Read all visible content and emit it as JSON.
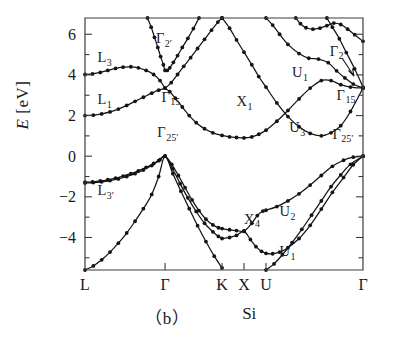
{
  "figure": {
    "caption_panel": "（b）",
    "caption_material": "Si",
    "ylabel_symbol": "E",
    "ylabel_unit": "[eV]"
  },
  "chart_data": {
    "type": "line",
    "title": "",
    "subtitle": "Si",
    "xlabel": "",
    "ylabel": "E [eV]",
    "ylim": [
      -5.6,
      6.8
    ],
    "yticks": [
      -4,
      -2,
      0,
      2,
      4,
      6
    ],
    "ytick_labels": [
      "-4",
      "-2",
      "0",
      "2",
      "4",
      "6"
    ],
    "yminor_step": 1,
    "grid": false,
    "legend_position": "none",
    "xaxis_type": "high-symmetry-path",
    "xticks": [
      0.0,
      0.288,
      0.493,
      0.572,
      0.651,
      1.0
    ],
    "xtick_labels": [
      "L",
      "Γ",
      "K",
      "X",
      "U",
      "Γ"
    ],
    "annotations": [
      {
        "text": "L",
        "sub": "3",
        "x": 0.045,
        "y": 4.62
      },
      {
        "text": "L",
        "sub": "1",
        "x": 0.045,
        "y": 2.55
      },
      {
        "text": "Γ",
        "sub": "2′",
        "x": 0.255,
        "y": 5.55
      },
      {
        "text": "Γ",
        "sub": "15",
        "x": 0.275,
        "y": 2.68
      },
      {
        "text": "Γ",
        "sub": "25′",
        "x": 0.26,
        "y": 0.92
      },
      {
        "text": "L",
        "sub": "3′",
        "x": 0.045,
        "y": -1.92
      },
      {
        "text": "X",
        "sub": "1",
        "x": 0.545,
        "y": 2.45
      },
      {
        "text": "X",
        "sub": "4",
        "x": 0.572,
        "y": -3.32
      },
      {
        "text": "U",
        "sub": "1",
        "x": 0.745,
        "y": 3.88
      },
      {
        "text": "U",
        "sub": "3",
        "x": 0.735,
        "y": 1.18
      },
      {
        "text": "U",
        "sub": "2",
        "x": 0.7,
        "y": -2.95
      },
      {
        "text": "U",
        "sub": "1",
        "x": 0.7,
        "y": -4.92
      },
      {
        "text": "Γ",
        "sub": "2",
        "x": 0.88,
        "y": 4.95
      },
      {
        "text": "Γ",
        "sub": "15",
        "x": 0.905,
        "y": 2.78
      },
      {
        "text": "Γ",
        "sub": "25′",
        "x": 0.89,
        "y": 0.85
      }
    ],
    "series": [
      {
        "name": "valence-band-1",
        "points": [
          [
            0.0,
            -1.28
          ],
          [
            0.027,
            -1.26
          ],
          [
            0.055,
            -1.22
          ],
          [
            0.082,
            -1.16
          ],
          [
            0.11,
            -1.08
          ],
          [
            0.137,
            -0.98
          ],
          [
            0.165,
            -0.86
          ],
          [
            0.192,
            -0.72
          ],
          [
            0.22,
            -0.55
          ],
          [
            0.247,
            -0.36
          ],
          [
            0.27,
            -0.17
          ],
          [
            0.288,
            0.0
          ],
          [
            0.312,
            -0.4
          ],
          [
            0.336,
            -0.95
          ],
          [
            0.36,
            -1.55
          ],
          [
            0.385,
            -2.15
          ],
          [
            0.41,
            -2.68
          ],
          [
            0.435,
            -3.1
          ],
          [
            0.46,
            -3.38
          ],
          [
            0.48,
            -3.52
          ],
          [
            0.493,
            -3.56
          ],
          [
            0.52,
            -3.62
          ],
          [
            0.545,
            -3.66
          ],
          [
            0.572,
            -3.68
          ],
          [
            0.6,
            -3.3
          ],
          [
            0.62,
            -2.92
          ],
          [
            0.64,
            -2.7
          ],
          [
            0.651,
            -2.66
          ],
          [
            0.69,
            -2.48
          ],
          [
            0.73,
            -2.2
          ],
          [
            0.77,
            -1.85
          ],
          [
            0.81,
            -1.42
          ],
          [
            0.85,
            -0.95
          ],
          [
            0.89,
            -0.5
          ],
          [
            0.93,
            -0.2
          ],
          [
            0.965,
            -0.05
          ],
          [
            1.0,
            0.0
          ]
        ]
      },
      {
        "name": "valence-band-2",
        "points": [
          [
            0.0,
            -1.32
          ],
          [
            0.03,
            -1.3
          ],
          [
            0.06,
            -1.26
          ],
          [
            0.09,
            -1.2
          ],
          [
            0.12,
            -1.12
          ],
          [
            0.15,
            -1.0
          ],
          [
            0.18,
            -0.86
          ],
          [
            0.21,
            -0.68
          ],
          [
            0.24,
            -0.46
          ],
          [
            0.265,
            -0.22
          ],
          [
            0.288,
            0.0
          ],
          [
            0.315,
            -0.62
          ],
          [
            0.342,
            -1.35
          ],
          [
            0.37,
            -2.05
          ],
          [
            0.4,
            -2.72
          ],
          [
            0.43,
            -3.3
          ],
          [
            0.46,
            -3.72
          ],
          [
            0.48,
            -3.95
          ],
          [
            0.493,
            -4.05
          ],
          [
            0.52,
            -4.0
          ],
          [
            0.545,
            -3.9
          ],
          [
            0.572,
            -3.7
          ],
          [
            0.595,
            -4.1
          ],
          [
            0.615,
            -4.45
          ],
          [
            0.635,
            -4.68
          ],
          [
            0.651,
            -4.78
          ],
          [
            0.675,
            -4.8
          ],
          [
            0.7,
            -4.72
          ],
          [
            0.73,
            -4.5
          ],
          [
            0.77,
            -4.05
          ],
          [
            0.81,
            -3.4
          ],
          [
            0.85,
            -2.6
          ],
          [
            0.89,
            -1.78
          ],
          [
            0.93,
            -1.05
          ],
          [
            0.965,
            -0.42
          ],
          [
            1.0,
            0.0
          ]
        ]
      },
      {
        "name": "valence-band-3-lower",
        "points": [
          [
            0.0,
            -5.6
          ],
          [
            0.03,
            -5.4
          ],
          [
            0.06,
            -5.1
          ],
          [
            0.09,
            -4.72
          ],
          [
            0.12,
            -4.28
          ],
          [
            0.15,
            -3.78
          ],
          [
            0.18,
            -3.2
          ],
          [
            0.21,
            -2.58
          ],
          [
            0.24,
            -1.88
          ],
          [
            0.265,
            -1.0
          ],
          [
            0.288,
            0.0
          ],
          [
            0.316,
            -0.86
          ],
          [
            0.345,
            -1.72
          ],
          [
            0.375,
            -2.58
          ],
          [
            0.405,
            -3.42
          ],
          [
            0.435,
            -4.2
          ],
          [
            0.465,
            -4.92
          ],
          [
            0.493,
            -5.5
          ]
        ]
      },
      {
        "name": "valence-band-3-right",
        "points": [
          [
            0.651,
            -5.6
          ],
          [
            0.68,
            -5.3
          ],
          [
            0.71,
            -4.85
          ],
          [
            0.745,
            -4.25
          ],
          [
            0.78,
            -3.6
          ],
          [
            0.815,
            -2.9
          ],
          [
            0.85,
            -2.2
          ],
          [
            0.885,
            -1.5
          ],
          [
            0.92,
            -0.92
          ],
          [
            0.955,
            -0.4
          ],
          [
            1.0,
            0.0
          ]
        ]
      },
      {
        "name": "conduction-band-1",
        "points": [
          [
            0.0,
            4.02
          ],
          [
            0.027,
            4.05
          ],
          [
            0.055,
            4.12
          ],
          [
            0.082,
            4.22
          ],
          [
            0.11,
            4.32
          ],
          [
            0.137,
            4.38
          ],
          [
            0.165,
            4.4
          ],
          [
            0.192,
            4.35
          ],
          [
            0.22,
            4.22
          ],
          [
            0.247,
            4.02
          ],
          [
            0.27,
            3.72
          ],
          [
            0.288,
            3.35
          ],
          [
            0.305,
            3.18
          ],
          [
            0.325,
            2.85
          ],
          [
            0.35,
            2.42
          ],
          [
            0.375,
            2.0
          ],
          [
            0.4,
            1.65
          ],
          [
            0.43,
            1.35
          ],
          [
            0.46,
            1.15
          ],
          [
            0.493,
            1.02
          ],
          [
            0.52,
            0.95
          ],
          [
            0.545,
            0.92
          ],
          [
            0.572,
            0.9
          ],
          [
            0.6,
            0.95
          ],
          [
            0.625,
            1.08
          ],
          [
            0.651,
            1.28
          ],
          [
            0.69,
            1.72
          ],
          [
            0.73,
            2.25
          ],
          [
            0.77,
            2.82
          ],
          [
            0.81,
            3.35
          ],
          [
            0.85,
            3.72
          ],
          [
            0.885,
            3.72
          ],
          [
            0.92,
            3.52
          ],
          [
            0.955,
            3.4
          ],
          [
            1.0,
            3.35
          ]
        ]
      },
      {
        "name": "conduction-band-2",
        "points": [
          [
            0.0,
            2.0
          ],
          [
            0.03,
            2.02
          ],
          [
            0.06,
            2.08
          ],
          [
            0.09,
            2.18
          ],
          [
            0.12,
            2.32
          ],
          [
            0.15,
            2.5
          ],
          [
            0.18,
            2.7
          ],
          [
            0.21,
            2.9
          ],
          [
            0.24,
            3.1
          ],
          [
            0.265,
            3.25
          ],
          [
            0.288,
            3.35
          ],
          [
            0.31,
            3.62
          ],
          [
            0.333,
            4.02
          ],
          [
            0.355,
            4.42
          ],
          [
            0.38,
            4.85
          ],
          [
            0.405,
            5.3
          ],
          [
            0.43,
            5.75
          ],
          [
            0.455,
            6.2
          ],
          [
            0.478,
            6.6
          ],
          [
            0.493,
            6.8
          ]
        ]
      },
      {
        "name": "conduction-band-3-gamma2prime",
        "points": [
          [
            0.225,
            6.8
          ],
          [
            0.238,
            6.35
          ],
          [
            0.25,
            5.85
          ],
          [
            0.262,
            5.35
          ],
          [
            0.272,
            4.9
          ],
          [
            0.282,
            4.5
          ],
          [
            0.288,
            4.22
          ],
          [
            0.296,
            4.22
          ],
          [
            0.305,
            4.35
          ],
          [
            0.318,
            4.62
          ],
          [
            0.333,
            4.95
          ],
          [
            0.35,
            5.35
          ],
          [
            0.37,
            5.8
          ],
          [
            0.39,
            6.28
          ],
          [
            0.41,
            6.8
          ]
        ]
      },
      {
        "name": "conduction-band-4-right-upper",
        "points": [
          [
            0.651,
            6.8
          ],
          [
            0.675,
            6.45
          ],
          [
            0.7,
            6.0
          ],
          [
            0.73,
            5.5
          ],
          [
            0.77,
            5.05
          ],
          [
            0.805,
            4.82
          ],
          [
            0.84,
            4.78
          ],
          [
            0.875,
            4.6
          ],
          [
            0.905,
            4.2
          ],
          [
            0.935,
            3.85
          ],
          [
            0.965,
            3.55
          ],
          [
            1.0,
            3.35
          ]
        ]
      },
      {
        "name": "conduction-band-5-right-top",
        "points": [
          [
            0.758,
            6.8
          ],
          [
            0.775,
            6.52
          ],
          [
            0.795,
            6.32
          ],
          [
            0.82,
            6.25
          ],
          [
            0.845,
            6.3
          ],
          [
            0.87,
            6.42
          ],
          [
            0.895,
            6.55
          ],
          [
            0.92,
            6.48
          ],
          [
            0.945,
            6.25
          ],
          [
            0.97,
            5.98
          ],
          [
            1.0,
            5.65
          ]
        ]
      },
      {
        "name": "conduction-band-6-right-steep",
        "points": [
          [
            0.87,
            6.8
          ],
          [
            0.89,
            6.35
          ],
          [
            0.915,
            5.78
          ],
          [
            0.94,
            5.1
          ],
          [
            0.97,
            4.3
          ],
          [
            1.0,
            3.4
          ]
        ]
      },
      {
        "name": "conduction-band-X1-branch",
        "points": [
          [
            0.493,
            6.8
          ],
          [
            0.52,
            6.3
          ],
          [
            0.545,
            5.72
          ],
          [
            0.572,
            5.12
          ],
          [
            0.6,
            4.5
          ],
          [
            0.625,
            3.92
          ],
          [
            0.651,
            3.4
          ],
          [
            0.69,
            2.62
          ],
          [
            0.73,
            1.95
          ],
          [
            0.77,
            1.45
          ],
          [
            0.81,
            1.12
          ],
          [
            0.85,
            1.0
          ],
          [
            0.885,
            1.15
          ],
          [
            0.92,
            1.5
          ],
          [
            0.955,
            2.2
          ],
          [
            1.0,
            3.35
          ]
        ]
      }
    ],
    "marker": "filled-circle",
    "marker_on_series": [
      "valence-band-1",
      "valence-band-2",
      "valence-band-3-lower",
      "valence-band-3-right",
      "conduction-band-1",
      "conduction-band-2",
      "conduction-band-3-gamma2prime",
      "conduction-band-4-right-upper",
      "conduction-band-5-right-top",
      "conduction-band-6-right-steep",
      "conduction-band-X1-branch"
    ]
  }
}
